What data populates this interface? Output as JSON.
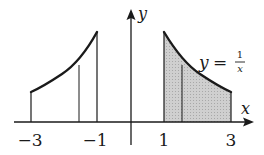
{
  "figure": {
    "type": "function-plot",
    "function": "y = 1/x",
    "x_axis_label": "x",
    "y_axis_label": "y",
    "equation_label": {
      "lhs": "y",
      "eq": "=",
      "numerator": "1",
      "denominator": "x"
    },
    "tick_labels": [
      "−3",
      "−1",
      "1",
      "3"
    ],
    "tick_values": [
      -3,
      -1,
      1,
      3
    ],
    "left_region": {
      "x_from": -3,
      "x_to": -1,
      "divider_x": -1.5,
      "shaded": false,
      "curve": "y = -1/x (reflected)"
    },
    "right_region": {
      "x_from": 1,
      "x_to": 3,
      "divider_x": 1.5,
      "shaded": true,
      "shade_color": "#c8c8c8"
    },
    "colors": {
      "ink": "#1a1a1a",
      "shade": "#c8c8c8"
    }
  }
}
